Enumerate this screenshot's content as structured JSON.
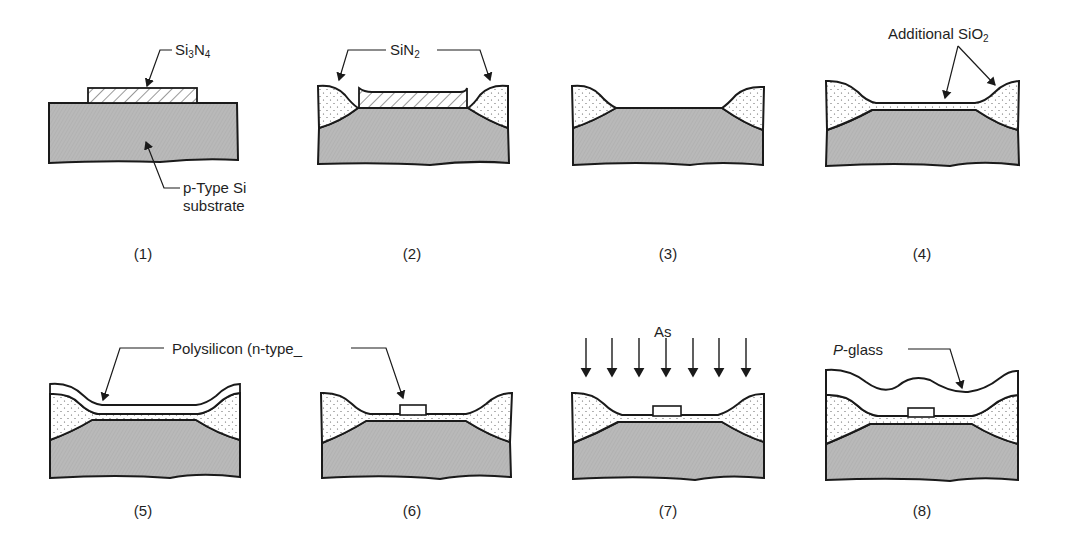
{
  "figure": {
    "colors": {
      "substrate": "#b8b8b8",
      "outline": "#1a1a1a",
      "oxide": "#ffffff",
      "background": "#ffffff"
    },
    "panels": [
      {
        "id": 1,
        "caption": "(1)",
        "labels": [
          {
            "text": "Si",
            "sub": "3",
            "text2": "N",
            "sub2": "4"
          },
          {
            "text": "p-Type Si"
          },
          {
            "text": "substrate"
          }
        ]
      },
      {
        "id": 2,
        "caption": "(2)",
        "labels": [
          {
            "text": "SiN",
            "sub": "2"
          }
        ]
      },
      {
        "id": 3,
        "caption": "(3)",
        "labels": []
      },
      {
        "id": 4,
        "caption": "(4)",
        "labels": [
          {
            "text": "Additional SiO",
            "sub": "2"
          }
        ]
      },
      {
        "id": 5,
        "caption": "(5)",
        "labels": [
          {
            "text": "Polysilicon (n-type_"
          }
        ]
      },
      {
        "id": 6,
        "caption": "(6)",
        "labels": []
      },
      {
        "id": 7,
        "caption": "(7)",
        "labels": [
          {
            "text": "As"
          }
        ]
      },
      {
        "id": 8,
        "caption": "(8)",
        "labels": [
          {
            "text_italic": "P",
            "text": "-glass"
          }
        ]
      }
    ]
  }
}
